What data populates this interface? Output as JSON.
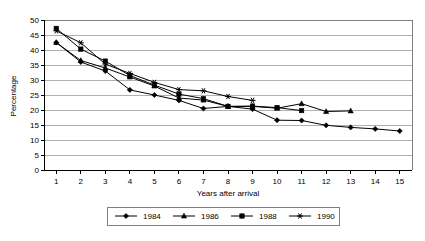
{
  "chart_data": {
    "type": "line",
    "title": "",
    "xlabel": "Years after arrival",
    "ylabel": "Percentage",
    "xlim": [
      0.5,
      15.5
    ],
    "ylim": [
      0,
      50
    ],
    "ytick_step": 5,
    "yticks": [
      0,
      5,
      10,
      15,
      20,
      25,
      30,
      35,
      40,
      45,
      50
    ],
    "xticks": [
      1,
      2,
      3,
      4,
      5,
      6,
      7,
      8,
      9,
      10,
      11,
      12,
      13,
      14,
      15
    ],
    "x": [
      1,
      2,
      3,
      4,
      5,
      6,
      7,
      8,
      9,
      10,
      11,
      12,
      13,
      14,
      15
    ],
    "grid": "horizontal",
    "legend_position": "bottom",
    "series": [
      {
        "name": "1984",
        "marker": "diamond",
        "color": "#000000",
        "values": [
          42.5,
          36.0,
          33.0,
          26.7,
          25.0,
          23.2,
          20.5,
          21.2,
          20.3,
          16.6,
          16.5,
          14.9,
          14.2,
          13.7,
          13.0
        ]
      },
      {
        "name": "1986",
        "marker": "triangle",
        "color": "#000000",
        "values": [
          42.5,
          36.5,
          34.0,
          31.0,
          28.0,
          24.0,
          23.3,
          21.2,
          21.2,
          20.6,
          22.1,
          19.5,
          19.7,
          null,
          null
        ]
      },
      {
        "name": "1988",
        "marker": "square",
        "color": "#000000",
        "values": [
          47.2,
          40.3,
          36.3,
          31.5,
          28.3,
          25.3,
          23.8,
          21.2,
          21.3,
          20.8,
          19.8,
          null,
          null,
          null,
          null
        ]
      },
      {
        "name": "1990",
        "marker": "asterisk",
        "color": "#000000",
        "values": [
          46.4,
          42.4,
          35.3,
          32.2,
          29.2,
          26.8,
          26.4,
          24.5,
          23.2,
          null,
          null,
          null,
          null,
          null,
          null
        ]
      }
    ]
  },
  "legend": {
    "items": [
      {
        "label": "1984",
        "marker": "diamond"
      },
      {
        "label": "1986",
        "marker": "triangle"
      },
      {
        "label": "1988",
        "marker": "square"
      },
      {
        "label": "1990",
        "marker": "asterisk"
      }
    ]
  },
  "colors": {
    "line": "#000000",
    "grid": "#b0b0b0",
    "frame": "#808080",
    "background": "#ffffff",
    "text": "#000000"
  }
}
